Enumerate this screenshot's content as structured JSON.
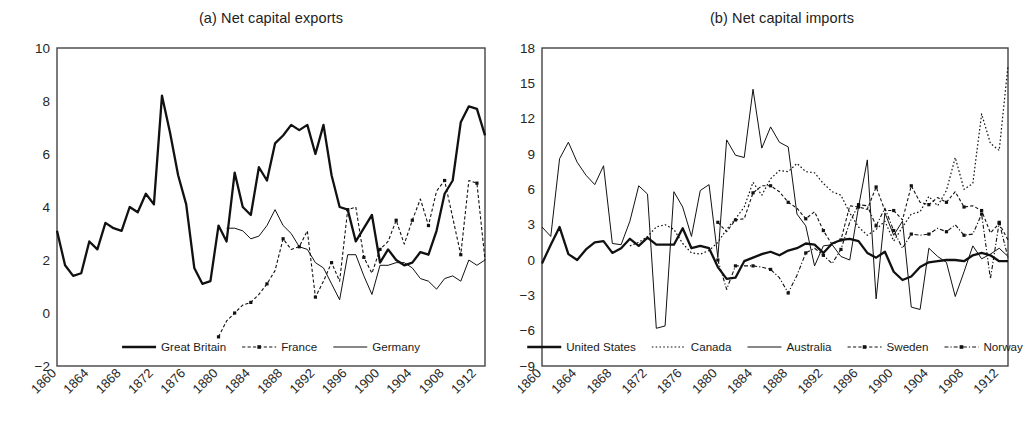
{
  "figure": {
    "panels": [
      {
        "id": "a",
        "title": "(a) Net capital exports",
        "ylim": [
          -2,
          10
        ],
        "yticks": [
          "10",
          "8",
          "6",
          "4",
          "2",
          "0",
          "-2"
        ],
        "xlim": [
          1860,
          1913
        ],
        "xticks": [
          "1860",
          "1864",
          "1868",
          "1872",
          "1876",
          "1880",
          "1884",
          "1888",
          "1892",
          "1896",
          "1900",
          "1904",
          "1908",
          "1912"
        ],
        "legend": [
          {
            "label": "Great Britain",
            "style": "thick-solid"
          },
          {
            "label": "France",
            "style": "dashed-marker"
          },
          {
            "label": "Germany",
            "style": "thin-solid"
          }
        ]
      },
      {
        "id": "b",
        "title": "(b) Net capital imports",
        "ylim": [
          -9,
          18
        ],
        "yticks": [
          "18",
          "15",
          "12",
          "9",
          "6",
          "3",
          "0",
          "-3",
          "-6",
          "-9"
        ],
        "xlim": [
          1860,
          1913
        ],
        "xticks": [
          "1860",
          "1864",
          "1868",
          "1872",
          "1876",
          "1880",
          "1884",
          "1888",
          "1892",
          "1896",
          "1900",
          "1904",
          "1908",
          "1912"
        ],
        "legend": [
          {
            "label": "United States",
            "style": "thick-solid"
          },
          {
            "label": "Canada",
            "style": "dotted"
          },
          {
            "label": "Australia",
            "style": "thin-solid"
          },
          {
            "label": "Sweden",
            "style": "dashed-marker"
          },
          {
            "label": "Norway",
            "style": "dashdot-marker"
          }
        ]
      }
    ]
  },
  "chart_data": [
    {
      "type": "line",
      "title": "(a) Net capital exports",
      "xlabel": "",
      "ylabel": "",
      "xlim": [
        1860,
        1913
      ],
      "ylim": [
        -2,
        10
      ],
      "grid": false,
      "legend_position": "bottom-center",
      "series": [
        {
          "name": "Great Britain",
          "style": "thick-solid",
          "x": [
            1860,
            1861,
            1862,
            1863,
            1864,
            1865,
            1866,
            1867,
            1868,
            1869,
            1870,
            1871,
            1872,
            1873,
            1874,
            1875,
            1876,
            1877,
            1878,
            1879,
            1880,
            1881,
            1882,
            1883,
            1884,
            1885,
            1886,
            1887,
            1888,
            1889,
            1890,
            1891,
            1892,
            1893,
            1894,
            1895,
            1896,
            1897,
            1898,
            1899,
            1900,
            1901,
            1902,
            1903,
            1904,
            1905,
            1906,
            1907,
            1908,
            1909,
            1910,
            1911,
            1912,
            1913
          ],
          "values": [
            3.1,
            1.8,
            1.4,
            1.5,
            2.7,
            2.4,
            3.4,
            3.2,
            3.1,
            4.0,
            3.8,
            4.5,
            4.1,
            8.2,
            6.8,
            5.2,
            4.1,
            1.7,
            1.1,
            1.2,
            3.3,
            2.7,
            5.3,
            4.0,
            3.7,
            5.5,
            5.0,
            6.4,
            6.7,
            7.1,
            6.9,
            7.1,
            6.0,
            7.1,
            5.2,
            4.0,
            3.9,
            2.7,
            3.2,
            3.7,
            1.9,
            2.4,
            2.0,
            1.8,
            1.9,
            2.3,
            2.2,
            3.1,
            4.5,
            5.0,
            7.2,
            7.8,
            7.7,
            6.7
          ]
        },
        {
          "name": "France",
          "style": "dashed-marker",
          "x": [
            1880,
            1881,
            1882,
            1883,
            1884,
            1885,
            1886,
            1887,
            1888,
            1889,
            1890,
            1891,
            1892,
            1893,
            1894,
            1895,
            1896,
            1897,
            1898,
            1899,
            1900,
            1901,
            1902,
            1903,
            1904,
            1905,
            1906,
            1907,
            1908,
            1909,
            1910,
            1911,
            1912,
            1913
          ],
          "values": [
            -0.9,
            -0.3,
            0.0,
            0.3,
            0.4,
            0.7,
            1.1,
            1.6,
            2.8,
            2.4,
            2.5,
            3.1,
            0.6,
            1.2,
            1.9,
            1.2,
            3.9,
            4.0,
            2.1,
            1.5,
            2.4,
            2.7,
            3.5,
            2.6,
            3.5,
            4.3,
            3.3,
            4.6,
            5.0,
            3.6,
            2.2,
            5.0,
            4.9,
            2.0
          ]
        },
        {
          "name": "Germany",
          "style": "thin-solid",
          "x": [
            1881,
            1882,
            1883,
            1884,
            1885,
            1886,
            1887,
            1888,
            1889,
            1890,
            1891,
            1892,
            1893,
            1894,
            1895,
            1896,
            1897,
            1898,
            1899,
            1900,
            1901,
            1902,
            1903,
            1904,
            1905,
            1906,
            1907,
            1908,
            1909,
            1910,
            1911,
            1912,
            1913
          ],
          "values": [
            3.2,
            3.2,
            3.1,
            2.8,
            2.9,
            3.3,
            3.9,
            3.3,
            3.0,
            2.5,
            2.4,
            1.9,
            1.7,
            1.1,
            0.5,
            2.2,
            2.2,
            1.4,
            0.7,
            1.8,
            1.8,
            1.9,
            1.9,
            1.7,
            1.3,
            1.2,
            0.9,
            1.3,
            1.4,
            1.2,
            2.0,
            1.8,
            2.0,
            4.3
          ]
        }
      ]
    },
    {
      "type": "line",
      "title": "(b) Net capital imports",
      "xlabel": "",
      "ylabel": "",
      "xlim": [
        1860,
        1913
      ],
      "ylim": [
        -9,
        18
      ],
      "grid": false,
      "legend_position": "bottom-center",
      "series": [
        {
          "name": "United States",
          "style": "thick-solid",
          "x": [
            1860,
            1861,
            1862,
            1863,
            1864,
            1865,
            1866,
            1867,
            1868,
            1869,
            1870,
            1871,
            1872,
            1873,
            1874,
            1875,
            1876,
            1877,
            1878,
            1879,
            1880,
            1881,
            1882,
            1883,
            1884,
            1885,
            1886,
            1887,
            1888,
            1889,
            1890,
            1891,
            1892,
            1893,
            1894,
            1895,
            1896,
            1897,
            1898,
            1899,
            1900,
            1901,
            1902,
            1903,
            1904,
            1905,
            1906,
            1907,
            1908,
            1909,
            1910,
            1911,
            1912,
            1913
          ],
          "values": [
            -0.3,
            1.3,
            2.8,
            0.5,
            0.0,
            0.9,
            1.5,
            1.6,
            0.6,
            1.0,
            1.8,
            1.2,
            1.9,
            1.3,
            1.3,
            1.3,
            2.7,
            1.0,
            1.2,
            1.0,
            -0.6,
            -1.6,
            -1.5,
            -0.1,
            0.2,
            0.5,
            0.7,
            0.4,
            0.8,
            1.0,
            1.4,
            1.3,
            0.6,
            1.4,
            1.7,
            1.8,
            1.6,
            0.6,
            0.2,
            0.7,
            -1.0,
            -1.7,
            -1.4,
            -0.6,
            -0.2,
            -0.1,
            0.0,
            0.0,
            -0.1,
            0.4,
            0.6,
            0.4,
            -0.1,
            -0.1
          ]
        },
        {
          "name": "Canada",
          "style": "dotted",
          "x": [
            1870,
            1871,
            1872,
            1873,
            1874,
            1875,
            1876,
            1877,
            1878,
            1879,
            1880,
            1881,
            1882,
            1883,
            1884,
            1885,
            1886,
            1887,
            1888,
            1889,
            1890,
            1891,
            1892,
            1893,
            1894,
            1895,
            1896,
            1897,
            1898,
            1899,
            1900,
            1901,
            1902,
            1903,
            1904,
            1905,
            1906,
            1907,
            1908,
            1909,
            1910,
            1911,
            1912,
            1913
          ],
          "values": [
            1.2,
            1.5,
            2.0,
            2.8,
            3.0,
            2.6,
            1.4,
            0.6,
            0.5,
            0.8,
            1.5,
            2.6,
            3.5,
            4.5,
            6.6,
            5.5,
            6.9,
            7.6,
            7.5,
            8.2,
            7.5,
            7.4,
            6.5,
            5.8,
            5.5,
            4.0,
            2.8,
            2.1,
            2.6,
            3.3,
            1.6,
            2.8,
            3.9,
            4.1,
            5.4,
            4.6,
            5.9,
            8.7,
            6.0,
            6.5,
            12.4,
            9.9,
            9.3,
            16.5
          ]
        },
        {
          "name": "Australia",
          "style": "thin-solid",
          "x": [
            1860,
            1861,
            1862,
            1863,
            1864,
            1865,
            1866,
            1867,
            1868,
            1869,
            1870,
            1871,
            1872,
            1873,
            1874,
            1875,
            1876,
            1877,
            1878,
            1879,
            1880,
            1881,
            1882,
            1883,
            1884,
            1885,
            1886,
            1887,
            1888,
            1889,
            1890,
            1891,
            1892,
            1893,
            1894,
            1895,
            1896,
            1897,
            1898,
            1899,
            1900,
            1901,
            1902,
            1903,
            1904,
            1905,
            1906,
            1907,
            1908,
            1909,
            1910,
            1911,
            1912,
            1913
          ],
          "values": [
            2.8,
            2.0,
            8.6,
            10.0,
            8.3,
            7.2,
            6.4,
            8.0,
            1.4,
            1.3,
            3.3,
            6.3,
            5.6,
            -5.8,
            -5.6,
            5.8,
            4.5,
            2.0,
            5.9,
            6.4,
            0.2,
            10.2,
            8.9,
            8.7,
            14.5,
            9.5,
            11.3,
            10.0,
            9.6,
            3.9,
            2.9,
            -0.5,
            1.2,
            1.3,
            0.3,
            0.0,
            4.5,
            8.5,
            -3.3,
            4.0,
            2.1,
            3.3,
            -4.0,
            -4.2,
            1.0,
            0.3,
            -0.2,
            -3.1,
            -1.0,
            1.2,
            0.1,
            0.5,
            1.0,
            0.3
          ]
        },
        {
          "name": "Sweden",
          "style": "dashed-marker",
          "x": [
            1880,
            1881,
            1882,
            1883,
            1884,
            1885,
            1886,
            1887,
            1888,
            1889,
            1890,
            1891,
            1892,
            1893,
            1894,
            1895,
            1896,
            1897,
            1898,
            1899,
            1900,
            1901,
            1902,
            1903,
            1904,
            1905,
            1906,
            1907,
            1908,
            1909,
            1910,
            1911,
            1912,
            1913
          ],
          "values": [
            3.2,
            2.4,
            3.4,
            3.5,
            5.7,
            6.3,
            6.3,
            5.8,
            4.9,
            4.4,
            3.5,
            4.1,
            2.5,
            1.3,
            1.7,
            4.6,
            4.5,
            4.3,
            6.2,
            4.2,
            4.2,
            3.4,
            6.3,
            4.9,
            4.7,
            5.3,
            4.9,
            5.8,
            4.5,
            4.6,
            4.2,
            2.3,
            3.1,
            1.7
          ]
        },
        {
          "name": "Norway",
          "style": "dashdot-marker",
          "x": [
            1880,
            1881,
            1882,
            1883,
            1884,
            1885,
            1886,
            1887,
            1888,
            1889,
            1890,
            1891,
            1892,
            1893,
            1894,
            1895,
            1896,
            1897,
            1898,
            1899,
            1900,
            1901,
            1902,
            1903,
            1904,
            1905,
            1906,
            1907,
            1908,
            1909,
            1910,
            1911,
            1912,
            1913
          ],
          "values": [
            0.0,
            -2.5,
            -0.5,
            -0.5,
            -0.5,
            -0.6,
            -0.8,
            -1.5,
            -2.8,
            -1.3,
            0.6,
            1.0,
            0.4,
            -0.3,
            0.9,
            3.2,
            4.7,
            4.6,
            2.9,
            4.4,
            2.5,
            1.0,
            2.2,
            2.1,
            2.2,
            2.7,
            2.4,
            3.0,
            2.1,
            2.2,
            3.9,
            -1.6,
            3.2,
            0.2
          ]
        }
      ]
    }
  ]
}
